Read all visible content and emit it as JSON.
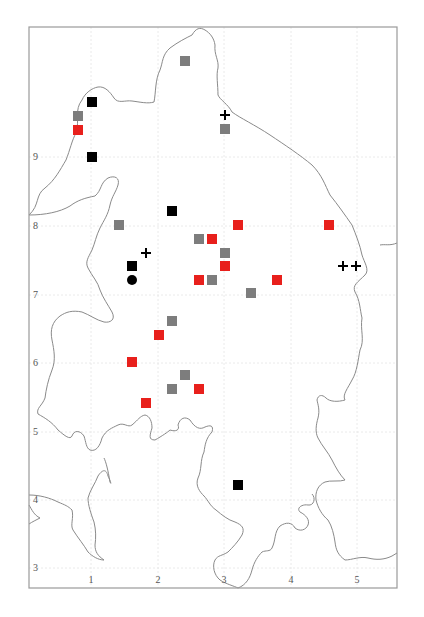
{
  "map": {
    "frame": {
      "x0": 29,
      "y0": 27,
      "x1": 397,
      "y1": 588
    },
    "x_axis": {
      "ticks": [
        {
          "label": "1",
          "value": 1,
          "px": 91
        },
        {
          "label": "2",
          "value": 2,
          "px": 158
        },
        {
          "label": "3",
          "value": 3,
          "px": 224
        },
        {
          "label": "4",
          "value": 4,
          "px": 291
        },
        {
          "label": "5",
          "value": 5,
          "px": 357
        }
      ]
    },
    "y_axis": {
      "ticks": [
        {
          "label": "9",
          "value": 9,
          "px": 157
        },
        {
          "label": "8",
          "value": 8,
          "px": 226
        },
        {
          "label": "7",
          "value": 7,
          "px": 295
        },
        {
          "label": "6",
          "value": 6,
          "px": 363
        },
        {
          "label": "5",
          "value": 5,
          "px": 432
        },
        {
          "label": "4",
          "value": 4,
          "px": 500
        },
        {
          "label": "3",
          "value": 3,
          "px": 568
        }
      ]
    },
    "colors": {
      "red": "#e8201c",
      "gray": "#7d7d7d",
      "black": "#000000",
      "coast": "#8a8a8a",
      "frame": "#9a9a9a"
    },
    "markers": [
      {
        "type": "square",
        "color": "gray",
        "x": 185,
        "y": 61
      },
      {
        "type": "square",
        "color": "black",
        "x": 92,
        "y": 102
      },
      {
        "type": "square",
        "color": "gray",
        "x": 78,
        "y": 116
      },
      {
        "type": "square",
        "color": "red",
        "x": 78,
        "y": 130
      },
      {
        "type": "square",
        "color": "black",
        "x": 92,
        "y": 157
      },
      {
        "type": "plus",
        "color": "black",
        "x": 225,
        "y": 115
      },
      {
        "type": "square",
        "color": "gray",
        "x": 225,
        "y": 129
      },
      {
        "type": "square",
        "color": "black",
        "x": 172,
        "y": 211
      },
      {
        "type": "square",
        "color": "gray",
        "x": 119,
        "y": 225
      },
      {
        "type": "square",
        "color": "red",
        "x": 238,
        "y": 225
      },
      {
        "type": "square",
        "color": "red",
        "x": 329,
        "y": 225
      },
      {
        "type": "square",
        "color": "gray",
        "x": 199,
        "y": 239
      },
      {
        "type": "square",
        "color": "red",
        "x": 212,
        "y": 239
      },
      {
        "type": "plus",
        "color": "black",
        "x": 146,
        "y": 253
      },
      {
        "type": "square",
        "color": "gray",
        "x": 225,
        "y": 253
      },
      {
        "type": "square",
        "color": "red",
        "x": 225,
        "y": 266
      },
      {
        "type": "square",
        "color": "black",
        "x": 132,
        "y": 266
      },
      {
        "type": "circle",
        "color": "black",
        "x": 132,
        "y": 280
      },
      {
        "type": "square",
        "color": "red",
        "x": 199,
        "y": 280
      },
      {
        "type": "square",
        "color": "gray",
        "x": 212,
        "y": 280
      },
      {
        "type": "square",
        "color": "red",
        "x": 277,
        "y": 280
      },
      {
        "type": "square",
        "color": "gray",
        "x": 251,
        "y": 293
      },
      {
        "type": "plus",
        "color": "black",
        "x": 343,
        "y": 266
      },
      {
        "type": "plus",
        "color": "black",
        "x": 356,
        "y": 266
      },
      {
        "type": "square",
        "color": "gray",
        "x": 172,
        "y": 321
      },
      {
        "type": "square",
        "color": "red",
        "x": 159,
        "y": 335
      },
      {
        "type": "square",
        "color": "red",
        "x": 132,
        "y": 362
      },
      {
        "type": "square",
        "color": "gray",
        "x": 185,
        "y": 375
      },
      {
        "type": "square",
        "color": "gray",
        "x": 172,
        "y": 389
      },
      {
        "type": "square",
        "color": "red",
        "x": 199,
        "y": 389
      },
      {
        "type": "square",
        "color": "red",
        "x": 146,
        "y": 403
      },
      {
        "type": "square",
        "color": "black",
        "x": 238,
        "y": 485
      }
    ]
  }
}
